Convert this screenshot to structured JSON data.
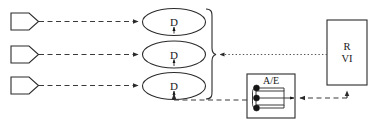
{
  "diagram": {
    "colors": {
      "stroke": "#2b2b2b",
      "connector": "#3a3a3a",
      "dotted": "#555555",
      "background": "#ffffff",
      "dot": "#151515"
    },
    "inputs": [
      {
        "id": "input-1",
        "label": ""
      },
      {
        "id": "input-2",
        "label": ""
      },
      {
        "id": "input-3",
        "label": ""
      }
    ],
    "processes": [
      {
        "id": "process-1",
        "label": "D"
      },
      {
        "id": "process-2",
        "label": "D"
      },
      {
        "id": "process-3",
        "label": "D"
      }
    ],
    "ae_box": {
      "label": "A/E",
      "dot_count": 3
    },
    "rvi_box": {
      "line1": "R",
      "line2": "VI"
    },
    "connectors": [
      {
        "id": "input-1-to-process-1",
        "style": "dashed",
        "arrow": "right"
      },
      {
        "id": "input-2-to-process-2",
        "style": "dashed",
        "arrow": "right"
      },
      {
        "id": "input-3-to-process-3",
        "style": "dashed",
        "arrow": "right"
      },
      {
        "id": "rvi-to-brace",
        "style": "dotted",
        "arrow": "left"
      },
      {
        "id": "rvi-to-ae",
        "style": "dashed",
        "arrow": "left"
      },
      {
        "id": "ae-to-process-3",
        "style": "dashed",
        "arrow": "up"
      },
      {
        "id": "ae-to-rvi",
        "style": "dashed",
        "arrow": "up"
      }
    ]
  }
}
